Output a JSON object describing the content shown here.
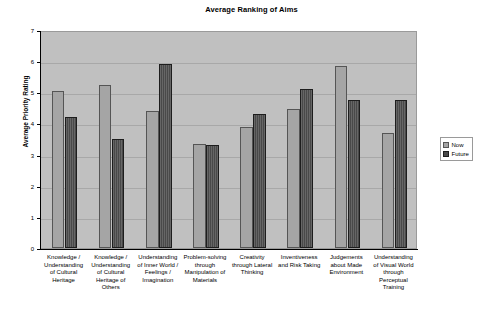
{
  "chart_data": {
    "type": "bar",
    "title": "Average Ranking of Aims",
    "xlabel": "",
    "ylabel": "Average Priority Rating",
    "ylim": [
      0,
      7
    ],
    "yticks": [
      0,
      1,
      2,
      3,
      4,
      5,
      6,
      7
    ],
    "grid": true,
    "legend_position": "right",
    "categories": [
      "Knowledge / Understanding of Cultural Heritage",
      "Knowledge / Understanding of Cultural Heritage of Others",
      "Understanding of Inner World / Feelings / Imagination",
      "Problem-solving through Manipulation of Materials",
      "Creativity through Lateral Thinking",
      "Inventiveness and Risk Taking",
      "Judgements about Made Environment",
      "Understanding of Visual World through Perceptual Training"
    ],
    "category_lines": [
      [
        "Knowledge /",
        "Understanding",
        "of Cultural",
        "Heritage"
      ],
      [
        "Knowledge /",
        "Understanding",
        "of Cultural",
        "Heritage of",
        "Others"
      ],
      [
        "Understanding",
        "of Inner World /",
        "Feelings /",
        "Imagination"
      ],
      [
        "Problem-solving",
        "through",
        "Manipulation of",
        "Materials"
      ],
      [
        "Creativity",
        "through Lateral",
        "Thinking"
      ],
      [
        "Inventiveness",
        "and Risk Taking"
      ],
      [
        "Judgements",
        "about Made",
        "Environment"
      ],
      [
        "Understanding",
        "of Visual World",
        "through",
        "Perceptual",
        "Training"
      ]
    ],
    "series": [
      {
        "name": "Now",
        "color": "#a5a5a5",
        "values": [
          5.05,
          5.25,
          4.4,
          3.35,
          3.9,
          4.45,
          5.85,
          3.7
        ]
      },
      {
        "name": "Future",
        "color": "#494949",
        "values": [
          4.2,
          3.5,
          5.9,
          3.3,
          4.3,
          5.1,
          4.75,
          4.75
        ]
      }
    ]
  },
  "legend": {
    "items": [
      {
        "label": "Now"
      },
      {
        "label": "Future"
      }
    ]
  }
}
